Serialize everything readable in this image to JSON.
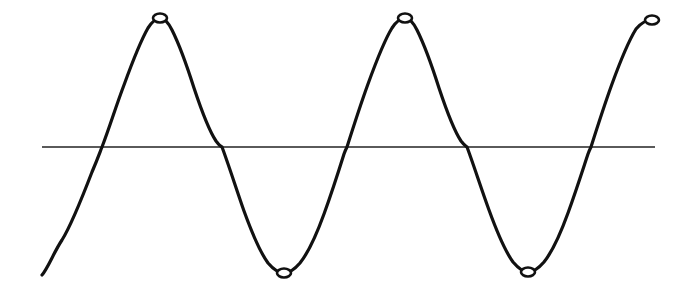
{
  "figure": {
    "background_color": "#ffffff",
    "width": 683,
    "height": 297
  },
  "chart_data": {
    "type": "line",
    "title": "",
    "subtitle": "",
    "xlabel": "",
    "ylabel": "",
    "grid": false,
    "legend": false,
    "legend_position": "none",
    "xlim": [
      0,
      683
    ],
    "ylim": [
      0,
      297
    ],
    "axis_range_note": "Pixel coordinates; y increases downward in image space",
    "series": [
      {
        "name": "sine-curve",
        "style": "hand-drawn-line",
        "color": "#111111",
        "stroke_width": 3.2,
        "baseline_y": 147,
        "amplitude_px": 128,
        "period_px": 245,
        "start_point": [
          42,
          275
        ],
        "end_point": [
          652,
          20
        ],
        "phase_note": "Begins mid-rise below baseline, ascends to first peak",
        "x": [
          42,
          62,
          82,
          102,
          122,
          142,
          160,
          180,
          200,
          222,
          242,
          262,
          284,
          304,
          324,
          347,
          367,
          387,
          405,
          425,
          445,
          467,
          487,
          507,
          528,
          548,
          568,
          591,
          611,
          631,
          652
        ],
        "y": [
          275,
          258,
          222,
          147,
          80,
          35,
          18,
          33,
          76,
          147,
          212,
          255,
          273,
          258,
          215,
          147,
          82,
          34,
          18,
          34,
          78,
          147,
          210,
          254,
          272,
          257,
          214,
          147,
          83,
          38,
          20
        ]
      },
      {
        "name": "horizontal-baseline",
        "style": "straight-line",
        "color": "#5a5a5a",
        "stroke_width": 1.2,
        "x": [
          42,
          655
        ],
        "y": [
          147,
          147
        ]
      }
    ],
    "markers": {
      "shape": "open-ellipse",
      "fill": "#ffffff",
      "stroke": "#111111",
      "stroke_width": 2.6,
      "radius_x": 7,
      "radius_y": 4.5,
      "peaks": [
        {
          "label": "peak-1",
          "x": 160,
          "y": 18
        },
        {
          "label": "peak-2",
          "x": 405,
          "y": 18
        },
        {
          "label": "peak-3",
          "x": 652,
          "y": 20
        }
      ],
      "troughs": [
        {
          "label": "trough-1",
          "x": 284,
          "y": 273
        },
        {
          "label": "trough-2",
          "x": 528,
          "y": 272
        }
      ]
    },
    "zero_crossings": [
      102,
      222,
      347,
      467,
      591
    ],
    "annotations": []
  },
  "colors": {
    "curve": "#111111",
    "baseline": "#5a5a5a",
    "marker_fill": "#ffffff",
    "marker_stroke": "#111111",
    "background": "#ffffff"
  },
  "geometry": {
    "curve_path": "M 42,275 C 48,268 54,252 62,240 C 72,224 82,198 92,172 C 98,158 100,152 102,147 C 110,126 116,106 124,85 C 132,63 140,42 148,28 C 152,22 156,18 160,18 C 164,18 168,22 172,30 C 180,46 187,66 194,88 C 202,112 210,132 216,141 C 219,145 220,146 222,147 C 228,163 236,188 244,211 C 252,233 260,252 268,263 C 274,270 279,273 284,273 C 289,273 294,270 300,263 C 308,253 316,236 324,214 C 332,192 339,170 344,154 C 345,151 346,149 347,147 C 353,128 360,106 368,84 C 376,62 384,41 392,28 C 396,22 400,18 405,18 C 409,18 413,22 417,30 C 425,46 432,66 439,88 C 447,112 455,132 461,141 C 464,145 466,146 467,147 C 473,163 481,188 489,210 C 497,232 505,251 513,262 C 519,269 523,272 528,272 C 533,272 538,269 544,262 C 552,252 560,235 568,213 C 576,191 583,169 588,154 C 589,151 590,149 591,147 C 597,128 604,106 612,84 C 620,62 628,42 636,29 C 641,23 646,20 652,20"
  }
}
